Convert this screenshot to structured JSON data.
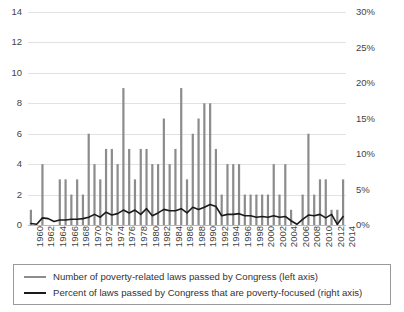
{
  "chart_data": {
    "type": "bar",
    "title": "",
    "subtitle": "",
    "xlabel": "",
    "ylabel": "",
    "grid": true,
    "legend_position": "bottom",
    "axes": {
      "left": {
        "label": "",
        "ylim": [
          0,
          14
        ],
        "ticks": [
          0,
          2,
          4,
          6,
          8,
          10,
          12,
          14
        ],
        "tick_labels": [
          "0",
          "2",
          "4",
          "6",
          "8",
          "10",
          "12",
          "14"
        ]
      },
      "right": {
        "label": "",
        "ylim": [
          0,
          30
        ],
        "ticks": [
          0,
          5,
          10,
          15,
          20,
          25,
          30
        ],
        "tick_labels": [
          "0%",
          "5%",
          "10%",
          "15%",
          "20%",
          "25%",
          "30%"
        ]
      },
      "x": {
        "label": "",
        "tick_labels": [
          "1960",
          "1962",
          "1964",
          "1966",
          "1968",
          "1970",
          "1972",
          "1974",
          "1976",
          "1978",
          "1980",
          "1982",
          "1984",
          "1986",
          "1988",
          "1990",
          "1992",
          "1994",
          "1996",
          "1998",
          "2000",
          "2002",
          "2004",
          "2006",
          "2008",
          "2010",
          "2012",
          "2014"
        ]
      }
    },
    "categories": [
      "1960",
      "1961",
      "1962",
      "1963",
      "1964",
      "1965",
      "1966",
      "1967",
      "1968",
      "1969",
      "1970",
      "1971",
      "1972",
      "1973",
      "1974",
      "1975",
      "1976",
      "1977",
      "1978",
      "1979",
      "1980",
      "1981",
      "1982",
      "1983",
      "1984",
      "1985",
      "1986",
      "1987",
      "1988",
      "1989",
      "1990",
      "1991",
      "1992",
      "1993",
      "1994",
      "1995",
      "1996",
      "1997",
      "1998",
      "1999",
      "2000",
      "2001",
      "2002",
      "2003",
      "2004",
      "2005",
      "2006",
      "2007",
      "2008",
      "2009",
      "2010",
      "2011",
      "2012",
      "2013",
      "2014"
    ],
    "series": [
      {
        "name": "Number of poverty-related laws passed by Congress (left axis)",
        "short_name": "laws-count",
        "type": "bar",
        "axis": "left",
        "color": "#8c8c8c",
        "values": [
          1,
          0,
          4,
          0,
          0,
          3,
          3,
          2,
          3,
          2,
          6,
          4,
          3,
          5,
          5,
          4,
          9,
          5,
          3,
          5,
          5,
          4,
          4,
          7,
          4,
          5,
          9,
          3,
          6,
          7,
          8,
          8,
          5,
          2,
          4,
          4,
          4,
          2,
          2,
          2,
          2,
          2,
          4,
          2,
          4,
          1,
          0,
          2,
          6,
          2,
          3,
          3,
          1,
          1,
          3
        ]
      },
      {
        "name": "Percent of laws passed by Congress that are poverty-focused (right axis)",
        "short_name": "laws-percent",
        "type": "line",
        "axis": "right",
        "color": "#1a1a1a",
        "values": [
          0.2,
          0.1,
          1.0,
          0.9,
          0.5,
          0.7,
          0.7,
          0.8,
          0.8,
          0.9,
          1.1,
          1.5,
          1.1,
          1.8,
          1.4,
          1.6,
          2.1,
          1.7,
          2.1,
          1.5,
          2.3,
          1.3,
          1.7,
          2.2,
          2.0,
          2.0,
          2.3,
          1.7,
          2.5,
          2.2,
          2.5,
          2.9,
          2.6,
          1.3,
          1.5,
          1.5,
          1.6,
          1.3,
          1.3,
          1.1,
          1.2,
          1.1,
          1.3,
          1.1,
          1.2,
          0.6,
          0.1,
          0.8,
          1.4,
          1.3,
          1.5,
          1.0,
          1.5,
          0.1,
          1.2
        ]
      }
    ],
    "legend": [
      {
        "marker": "bar-swatch",
        "label": "Number of poverty-related laws passed by Congress (left axis)"
      },
      {
        "marker": "line-swatch",
        "label": "Percent of laws passed by Congress that are poverty-focused (right axis)"
      }
    ]
  }
}
